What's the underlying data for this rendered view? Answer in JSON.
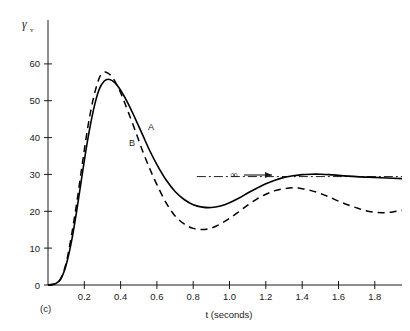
{
  "figure": {
    "panel_label": "(c)",
    "y_axis_symbol": "γ",
    "y_axis_subscript": "v",
    "x_axis_title": "t (seconds)",
    "asymptote_symbol": "∞",
    "curve_label_a": "A",
    "curve_label_b": "B"
  },
  "chart_data": {
    "type": "line",
    "title": "",
    "xlabel": "t (seconds)",
    "ylabel": "γv",
    "xlim": [
      0,
      1.95
    ],
    "ylim": [
      0,
      66
    ],
    "xticks": [
      0.2,
      0.4,
      0.6,
      0.8,
      1.0,
      1.2,
      1.4,
      1.6,
      1.8
    ],
    "xtick_labels": [
      "0.2",
      "0.4",
      "0.6",
      "0.8",
      "1.0",
      "1.2",
      "1.4",
      "1.6",
      "1.8"
    ],
    "yticks": [
      0,
      10,
      20,
      30,
      40,
      50,
      60
    ],
    "ytick_labels": [
      "0",
      "10",
      "20",
      "30",
      "40",
      "50",
      "60"
    ],
    "grid": false,
    "legend_position": "inline-annotations",
    "annotations": [
      {
        "text": "∞",
        "x": 1.12,
        "y": 29,
        "note": "asymptotic value arrow"
      },
      {
        "text": "A",
        "x": 0.55,
        "y": 41,
        "note": "solid curve label"
      },
      {
        "text": "B",
        "x": 0.5,
        "y": 36,
        "note": "dashed curve label"
      },
      {
        "text": "(c)",
        "x": 0.04,
        "y": -6,
        "note": "panel identifier"
      }
    ],
    "asymptote_line": {
      "y": 27,
      "x_start": 0.82,
      "x_end": 1.95,
      "style": "dash-dot"
    },
    "series": [
      {
        "name": "A",
        "style": "solid",
        "x": [
          0.0,
          0.04,
          0.07,
          0.1,
          0.13,
          0.16,
          0.19,
          0.22,
          0.25,
          0.28,
          0.31,
          0.34,
          0.37,
          0.4,
          0.44,
          0.48,
          0.52,
          0.56,
          0.6,
          0.65,
          0.7,
          0.75,
          0.8,
          0.85,
          0.9,
          0.95,
          1.0,
          1.05,
          1.1,
          1.15,
          1.2,
          1.25,
          1.3,
          1.35,
          1.4,
          1.45,
          1.5,
          1.55,
          1.6,
          1.7,
          1.8,
          1.9,
          1.95
        ],
        "y": [
          0.0,
          0.3,
          1.5,
          5.0,
          11.0,
          19.0,
          28.0,
          36.5,
          43.5,
          48.5,
          50.8,
          51.2,
          50.3,
          48.5,
          45.3,
          41.5,
          37.5,
          33.5,
          30.0,
          26.2,
          23.3,
          21.3,
          20.0,
          19.4,
          19.3,
          19.7,
          20.5,
          21.6,
          22.9,
          24.1,
          25.2,
          26.1,
          26.8,
          27.2,
          27.5,
          27.6,
          27.6,
          27.5,
          27.3,
          27.0,
          26.8,
          26.6,
          26.5
        ]
      },
      {
        "name": "B",
        "style": "dashed",
        "x": [
          0.0,
          0.04,
          0.07,
          0.1,
          0.13,
          0.16,
          0.19,
          0.22,
          0.25,
          0.28,
          0.3,
          0.32,
          0.35,
          0.38,
          0.41,
          0.44,
          0.48,
          0.52,
          0.56,
          0.6,
          0.65,
          0.7,
          0.75,
          0.8,
          0.85,
          0.9,
          0.95,
          1.0,
          1.05,
          1.1,
          1.15,
          1.2,
          1.25,
          1.3,
          1.35,
          1.4,
          1.45,
          1.5,
          1.55,
          1.6,
          1.65,
          1.7,
          1.75,
          1.8,
          1.85,
          1.9,
          1.95
        ],
        "y": [
          0.0,
          0.3,
          1.6,
          5.5,
          12.5,
          21.0,
          30.5,
          39.5,
          46.5,
          51.3,
          52.7,
          53.0,
          52.0,
          49.8,
          46.8,
          43.3,
          38.5,
          33.5,
          29.0,
          25.0,
          20.5,
          17.2,
          15.2,
          14.1,
          13.8,
          14.2,
          15.2,
          16.6,
          18.2,
          19.9,
          21.4,
          22.6,
          23.5,
          24.0,
          24.2,
          24.0,
          23.5,
          22.8,
          21.9,
          20.9,
          20.0,
          19.2,
          18.5,
          18.1,
          18.0,
          18.2,
          18.6
        ]
      }
    ]
  }
}
